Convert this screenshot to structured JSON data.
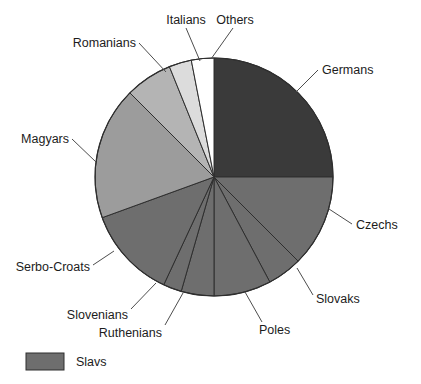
{
  "chart_data": {
    "type": "pie",
    "title": "",
    "subtitle": "",
    "xlabel": "",
    "ylabel": "",
    "grid": false,
    "legend_position": "bottom-left",
    "center": {
      "x": 214,
      "y": 177
    },
    "radius": 119,
    "start_angle_deg": 0,
    "direction": "clockwise",
    "categories": [
      "Germans",
      "Czechs",
      "Slovaks",
      "Poles",
      "Ruthenians",
      "Slovenians",
      "Serbo-Croats",
      "Magyars",
      "Romanians",
      "Italians",
      "Others"
    ],
    "values": [
      25.0,
      12.5,
      4.7,
      7.8,
      4.4,
      2.5,
      12.6,
      18.1,
      6.4,
      3.1,
      2.9
    ],
    "colors": [
      "#3a3a3a",
      "#6e6e6e",
      "#6e6e6e",
      "#6e6e6e",
      "#6e6e6e",
      "#6e6e6e",
      "#6e6e6e",
      "#9c9c9c",
      "#b4b4b4",
      "#dcdcdc",
      "#ffffff"
    ],
    "slice_angles_deg": [
      {
        "name": "Germans",
        "start": 0,
        "end": 90
      },
      {
        "name": "Czechs",
        "start": 90,
        "end": 135
      },
      {
        "name": "Slovaks",
        "start": 135,
        "end": 152
      },
      {
        "name": "Poles",
        "start": 152,
        "end": 180
      },
      {
        "name": "Ruthenians",
        "start": 180,
        "end": 196
      },
      {
        "name": "Slovenians",
        "start": 196,
        "end": 205
      },
      {
        "name": "Serbo-Croats",
        "start": 205,
        "end": 250
      },
      {
        "name": "Magyars",
        "start": 250,
        "end": 315
      },
      {
        "name": "Romanians",
        "start": 315,
        "end": 338
      },
      {
        "name": "Italians",
        "start": 338,
        "end": 349
      },
      {
        "name": "Others",
        "start": 349,
        "end": 360
      }
    ],
    "legend": [
      {
        "label": "Slavs",
        "color": "#6e6e6e"
      }
    ]
  },
  "labels": {
    "germans": "Germans",
    "czechs": "Czechs",
    "slovaks": "Slovaks",
    "poles": "Poles",
    "ruthenians": "Ruthenians",
    "slovenians": "Slovenians",
    "serbo_croats": "Serbo-Croats",
    "magyars": "Magyars",
    "romanians": "Romanians",
    "italians": "Italians",
    "others": "Others"
  },
  "legend": {
    "slavs_label": "Slavs",
    "slavs_color": "#6e6e6e"
  }
}
